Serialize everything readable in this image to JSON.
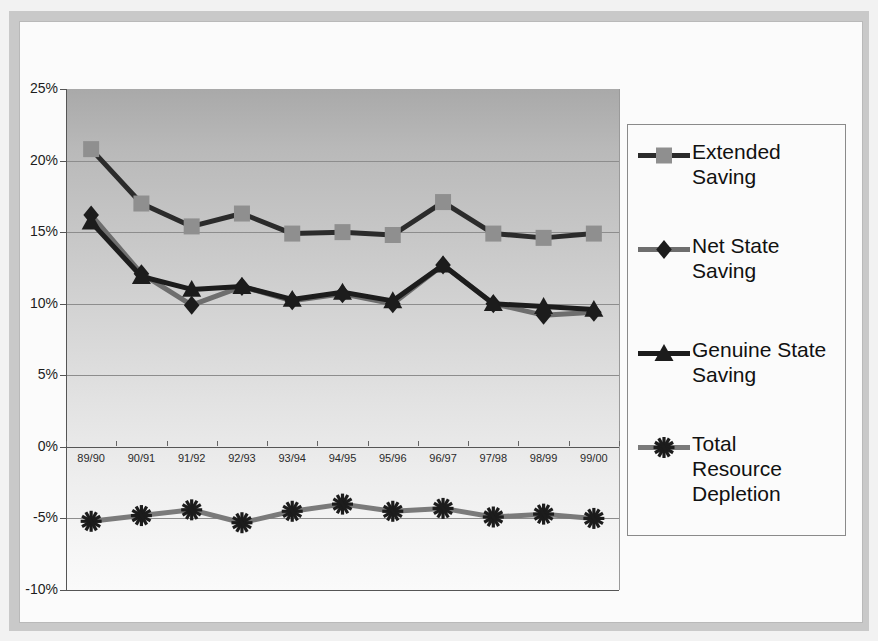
{
  "chart_data": {
    "type": "line",
    "title": "",
    "xlabel": "",
    "ylabel": "",
    "categories": [
      "89/90",
      "90/91",
      "91/92",
      "92/93",
      "93/94",
      "94/95",
      "95/96",
      "96/97",
      "97/98",
      "98/99",
      "99/00"
    ],
    "ylim": [
      -10,
      25
    ],
    "ytick_step": 5,
    "ytick_labels": [
      "25%",
      "20%",
      "15%",
      "10%",
      "5%",
      "0%",
      "-5%",
      "-10%"
    ],
    "ytick_values": [
      25,
      20,
      15,
      10,
      5,
      0,
      -5,
      -10
    ],
    "grid": true,
    "legend_position": "right",
    "value_suffix": "%",
    "series": [
      {
        "name": "Extended Saving",
        "marker": "square",
        "line_color": "#2b2b2b",
        "marker_color": "#8f8f8f",
        "values": [
          20.8,
          17.0,
          15.4,
          16.3,
          14.9,
          15.0,
          14.8,
          17.1,
          14.9,
          14.6,
          14.9
        ]
      },
      {
        "name": "Net State Saving",
        "marker": "diamond",
        "line_color": "#6e6e6e",
        "marker_color": "#1c1c1c",
        "values": [
          16.2,
          12.1,
          9.9,
          11.2,
          10.2,
          10.7,
          10.0,
          12.7,
          10.0,
          9.2,
          9.4
        ]
      },
      {
        "name": "Genuine State Saving",
        "marker": "triangle",
        "line_color": "#1c1c1c",
        "marker_color": "#1c1c1c",
        "values": [
          15.7,
          11.9,
          11.0,
          11.2,
          10.3,
          10.8,
          10.2,
          12.7,
          10.0,
          9.8,
          9.6
        ]
      },
      {
        "name": "Total Resource Depletion",
        "marker": "asterisk",
        "line_color": "#7a7a7a",
        "marker_color": "#1c1c1c",
        "values": [
          -5.2,
          -4.8,
          -4.4,
          -5.3,
          -4.5,
          -4.0,
          -4.5,
          -4.3,
          -4.9,
          -4.7,
          -5.0
        ]
      }
    ]
  },
  "legend": {
    "entries": [
      {
        "label_line1": "Extended",
        "label_line2": "Saving",
        "label_line3": ""
      },
      {
        "label_line1": "Net State",
        "label_line2": "Saving",
        "label_line3": ""
      },
      {
        "label_line1": "Genuine State",
        "label_line2": "Saving",
        "label_line3": ""
      },
      {
        "label_line1": "Total",
        "label_line2": "Resource",
        "label_line3": "Depletion"
      }
    ]
  }
}
